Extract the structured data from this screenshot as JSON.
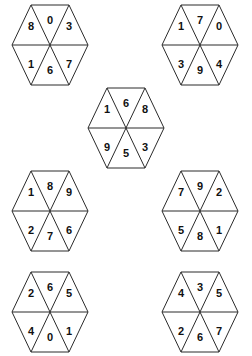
{
  "figure": {
    "background_color": "#ffffff",
    "stroke_color": "#2b2b2b",
    "digit_color": "#111111",
    "shape": "hexagon",
    "sectors_per_shape": 6,
    "sector_order": [
      "top",
      "upper-right",
      "lower-right",
      "bottom",
      "lower-left",
      "upper-left"
    ]
  },
  "hexagons": [
    {
      "id": "hex-1",
      "position": "top-left",
      "cx": 50,
      "cy": 45,
      "rx": 38,
      "ry": 40,
      "cells": {
        "top": "0",
        "upper_right": "3",
        "lower_right": "7",
        "bottom": "6",
        "lower_left": "1",
        "upper_left": "8"
      },
      "digits": [
        "0",
        "3",
        "7",
        "6",
        "1",
        "8"
      ]
    },
    {
      "id": "hex-2",
      "position": "top-right",
      "cx": 200,
      "cy": 45,
      "rx": 38,
      "ry": 40,
      "cells": {
        "top": "7",
        "upper_right": "0",
        "lower_right": "4",
        "bottom": "9",
        "lower_left": "3",
        "upper_left": "1"
      },
      "digits": [
        "7",
        "0",
        "4",
        "9",
        "3",
        "1"
      ]
    },
    {
      "id": "hex-3",
      "position": "middle-center",
      "cx": 126,
      "cy": 128,
      "rx": 38,
      "ry": 40,
      "cells": {
        "top": "6",
        "upper_right": "8",
        "lower_right": "3",
        "bottom": "5",
        "lower_left": "9",
        "upper_left": "1"
      },
      "digits": [
        "6",
        "8",
        "3",
        "5",
        "9",
        "1"
      ]
    },
    {
      "id": "hex-4",
      "position": "third-row-left",
      "cx": 50,
      "cy": 211,
      "rx": 38,
      "ry": 40,
      "cells": {
        "top": "8",
        "upper_right": "9",
        "lower_right": "6",
        "bottom": "7",
        "lower_left": "2",
        "upper_left": "1"
      },
      "digits": [
        "8",
        "9",
        "6",
        "7",
        "2",
        "1"
      ]
    },
    {
      "id": "hex-5",
      "position": "third-row-right",
      "cx": 200,
      "cy": 211,
      "rx": 38,
      "ry": 40,
      "cells": {
        "top": "9",
        "upper_right": "2",
        "lower_right": "1",
        "bottom": "8",
        "lower_left": "5",
        "upper_left": "7"
      },
      "digits": [
        "9",
        "2",
        "1",
        "8",
        "5",
        "7"
      ]
    },
    {
      "id": "hex-6",
      "position": "bottom-left",
      "cx": 50,
      "cy": 312,
      "rx": 38,
      "ry": 40,
      "cells": {
        "top": "6",
        "upper_right": "5",
        "lower_right": "1",
        "bottom": "0",
        "lower_left": "4",
        "upper_left": "2"
      },
      "digits": [
        "6",
        "5",
        "1",
        "0",
        "4",
        "2"
      ]
    },
    {
      "id": "hex-7",
      "position": "bottom-right",
      "cx": 200,
      "cy": 312,
      "rx": 38,
      "ry": 40,
      "cells": {
        "top": "3",
        "upper_right": "5",
        "lower_right": "7",
        "bottom": "6",
        "lower_left": "2",
        "upper_left": "4"
      },
      "digits": [
        "3",
        "5",
        "7",
        "6",
        "2",
        "4"
      ]
    }
  ]
}
